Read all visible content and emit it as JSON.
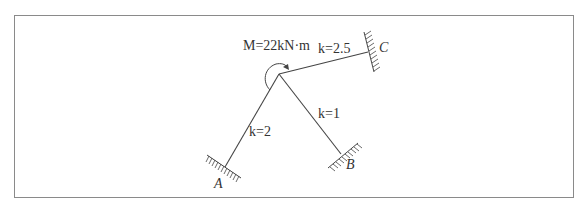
{
  "diagram": {
    "type": "rigid frame with fixed supports",
    "moment": {
      "symbol": "M",
      "label": "M=22kN·m",
      "value": 22,
      "unit": "kN·m",
      "direction": "counterclockwise"
    },
    "members": [
      {
        "name": "joint-to-A",
        "label": "k=2",
        "k": 2
      },
      {
        "name": "joint-to-B",
        "label": "k=1",
        "k": 1
      },
      {
        "name": "joint-to-C",
        "label": "k=2.5",
        "k": 2.5
      }
    ],
    "supports": [
      {
        "id": "A",
        "label": "A",
        "type": "fixed"
      },
      {
        "id": "B",
        "label": "B",
        "type": "fixed"
      },
      {
        "id": "C",
        "label": "C",
        "type": "fixed"
      }
    ],
    "colors": {
      "line": "#444444",
      "text": "#333333",
      "frame": "#8a8a8a"
    }
  }
}
